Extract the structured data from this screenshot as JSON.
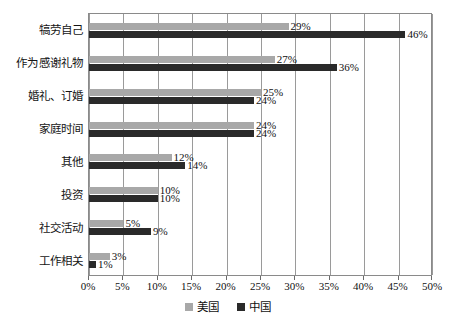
{
  "chart_data": {
    "type": "bar",
    "orientation": "horizontal",
    "title": "",
    "subtitle": "",
    "xlabel": "",
    "ylabel": "",
    "xlim": [
      0,
      50
    ],
    "xtick_step": 5,
    "xticks": [
      "0%",
      "5%",
      "10%",
      "15%",
      "20%",
      "25%",
      "30%",
      "35%",
      "40%",
      "45%",
      "50%"
    ],
    "grid": true,
    "grid_axis": "x",
    "legend_position": "bottom-center",
    "categories": [
      "犒劳自己",
      "作为感谢礼物",
      "婚礼、订婚",
      "家庭时间",
      "其他",
      "投资",
      "社交活动",
      "工作相关"
    ],
    "series": [
      {
        "name": "美国",
        "color": "#a8a8a8",
        "values": [
          29,
          27,
          25,
          24,
          12,
          10,
          5,
          3
        ],
        "labels": [
          "29%",
          "27%",
          "25%",
          "24%",
          "12%",
          "10%",
          "5%",
          "3%"
        ]
      },
      {
        "name": "中国",
        "color": "#2a2a2a",
        "values": [
          46,
          36,
          24,
          24,
          14,
          10,
          9,
          1
        ],
        "labels": [
          "46%",
          "36%",
          "24%",
          "24%",
          "14%",
          "10%",
          "9%",
          "1%"
        ]
      }
    ]
  },
  "legend": {
    "items": [
      {
        "label": "美国",
        "color": "#a8a8a8"
      },
      {
        "label": "中国",
        "color": "#2a2a2a"
      }
    ]
  },
  "colors": {
    "series_us": "#a8a8a8",
    "series_cn": "#2a2a2a",
    "gridline": "#9a9a9a",
    "frame": "#8a8a8a",
    "text": "#111111",
    "background": "#ffffff"
  }
}
